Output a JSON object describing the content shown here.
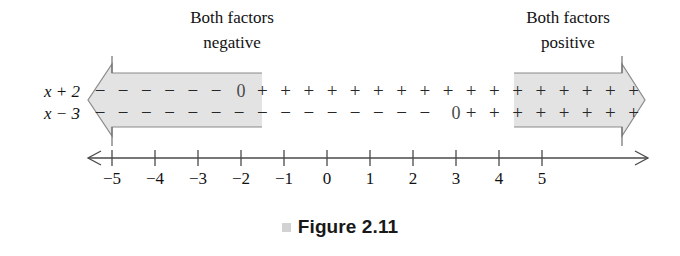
{
  "figure": {
    "caption": "Figure 2.11",
    "caption_marker": "square-marker",
    "background_color": "#ffffff",
    "shade_color": "#e3e3e3",
    "outline_color": "#8a8a8a",
    "ink_color": "#262626"
  },
  "annotations": [
    {
      "id": "left",
      "line1": "Both factors",
      "line2": "negative",
      "x": 232
    },
    {
      "id": "right",
      "line1": "Both factors",
      "line2": "positive",
      "x": 568
    }
  ],
  "rows": [
    {
      "id": "row-x-plus-2",
      "label": "x + 2",
      "zero_label": "0",
      "zero_value": -2,
      "sign_left": "−",
      "sign_right": "+"
    },
    {
      "id": "row-x-minus-3",
      "label": "x − 3",
      "zero_label": "0",
      "zero_value": 3,
      "sign_left": "−",
      "sign_right": "+"
    }
  ],
  "number_line": {
    "ticks": [
      "-5",
      "-4",
      "-3",
      "-2",
      "-1",
      "0",
      "1",
      "2",
      "3",
      "4",
      "5"
    ],
    "tick_values": [
      -5,
      -4,
      -3,
      -2,
      -1,
      0,
      1,
      2,
      3,
      4,
      5
    ],
    "left_arrow": "left-arrow",
    "right_arrow": "right-arrow"
  },
  "shaded_regions": [
    {
      "id": "negative-region",
      "from": "-∞",
      "to": -2,
      "meaning": "Both factors negative"
    },
    {
      "id": "positive-region",
      "from": 3,
      "to": "∞",
      "meaning": "Both factors positive"
    }
  ],
  "chart_data": {
    "type": "table",
    "title": "Figure 2.11",
    "xlabel": "",
    "ylabel": "",
    "x": [
      -5,
      -4,
      -3,
      -2,
      -1,
      0,
      1,
      2,
      3,
      4,
      5
    ],
    "xlim": [
      -6.1,
      6.1
    ],
    "grid": false,
    "legend": null,
    "series": [
      {
        "name": "x + 2",
        "sign_at": [
          "−",
          "−",
          "−",
          "0",
          "+",
          "+",
          "+",
          "+",
          "+",
          "+",
          "+"
        ],
        "zero_at": -2
      },
      {
        "name": "x − 3",
        "sign_at": [
          "−",
          "−",
          "−",
          "−",
          "−",
          "−",
          "−",
          "−",
          "0",
          "+",
          "+"
        ],
        "zero_at": 3
      }
    ],
    "annotations": [
      {
        "text": "Both factors negative",
        "region": [
          -6.1,
          -2
        ]
      },
      {
        "text": "Both factors positive",
        "region": [
          3,
          6.1
        ]
      }
    ]
  },
  "geometry": {
    "x_for_minus5": 112,
    "px_per_unit": 43,
    "row1_baseline": 97,
    "row2_baseline": 119,
    "band_top": 73,
    "band_bottom": 127,
    "axis_y": 158,
    "tick_label_y": 184,
    "arrow_left_tip": 88,
    "arrow_right_tip": 645,
    "left_shade_end": 262,
    "right_shade_start": 514
  }
}
